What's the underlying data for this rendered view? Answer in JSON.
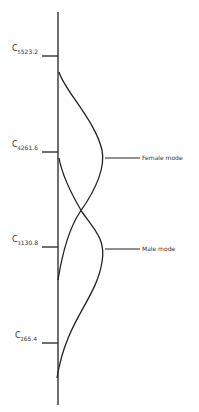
{
  "diagram": {
    "ticks": [
      {
        "note": "C",
        "octave": "5",
        "freq": "523.2",
        "y": 56
      },
      {
        "note": "C",
        "octave": "4",
        "freq": "261.6",
        "y": 152
      },
      {
        "note": "C",
        "octave": "3",
        "freq": "130.8",
        "y": 247
      },
      {
        "note": "C",
        "octave": "2",
        "freq": "65.4",
        "y": 343
      }
    ],
    "curves": [
      {
        "name": "Female mode",
        "label": "Female mode",
        "start_y": 72,
        "peak_y": 158,
        "end_y": 280
      },
      {
        "name": "Male mode",
        "label": "Male mode",
        "start_y": 158,
        "peak_y": 249,
        "end_y": 378
      }
    ],
    "line_color": "#222222"
  }
}
